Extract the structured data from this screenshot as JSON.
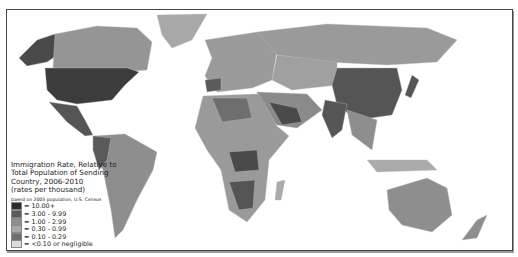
{
  "legend": {
    "title_lines": [
      "Immigration Rate, Relative to",
      "Total Population of Sending",
      "Country,  2006-2010",
      "(rates per thousand)"
    ],
    "note": "based on 2005 population, U.S. Census",
    "items": [
      {
        "label": "= 10.00+",
        "color": "#2e2e2e"
      },
      {
        "label": "= 3.00 - 9.99",
        "color": "#5a5a5a"
      },
      {
        "label": "= 1.00 - 2.99",
        "color": "#8e8e8e"
      },
      {
        "label": "= 0.30 - 0.99",
        "color": "#a8a8a8"
      },
      {
        "label": "= 0.10 - 0.29",
        "color": "#6e6e6e"
      },
      {
        "label": "= <0.10 or negligible",
        "color": "#dcdcdc"
      }
    ]
  },
  "colors": {
    "ocean": "#ffffff",
    "border": "#444444"
  }
}
